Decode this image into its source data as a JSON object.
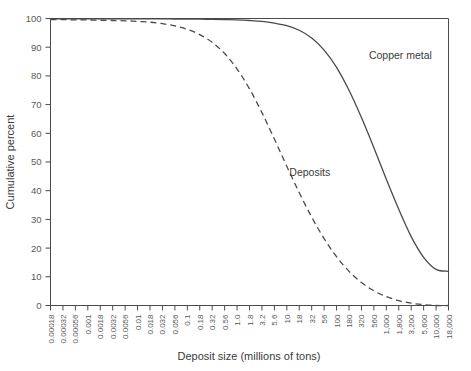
{
  "chart_data": {
    "type": "line",
    "title": "",
    "xlabel": "Deposit size (millions of tons)",
    "ylabel": "Cumulative percent",
    "ylim": [
      0,
      100
    ],
    "yticks": [
      0,
      10,
      20,
      30,
      40,
      50,
      60,
      70,
      80,
      90,
      100
    ],
    "grid": false,
    "legend_position": "inline-annotation",
    "xscale": "log",
    "categories": [
      "0.00018",
      "0.00032",
      "0.00056",
      "0.001",
      "0.0018",
      "0.0032",
      "0.0056",
      "0.01",
      "0.018",
      "0.032",
      "0.056",
      "0.1",
      "0.18",
      "0.32",
      "0.56",
      "1.0",
      "1.8",
      "3.2",
      "5.6",
      "10",
      "18",
      "32",
      "56",
      "100",
      "180",
      "320",
      "560",
      "1,000",
      "1,800",
      "3,200",
      "5,600",
      "10,000",
      "18,000"
    ],
    "series": [
      {
        "name": "Deposits",
        "style": "dashed",
        "label_x_index": 19.2,
        "label_y": 45,
        "values": [
          99.6,
          99.6,
          99.5,
          99.5,
          99.4,
          99.3,
          99.2,
          99.0,
          98.7,
          98.2,
          97.4,
          96.2,
          94.4,
          91.7,
          87.8,
          82.4,
          75.5,
          67.2,
          58.0,
          48.5,
          39.3,
          30.8,
          23.3,
          17.0,
          11.9,
          8.0,
          5.1,
          3.1,
          1.7,
          0.8,
          0.3,
          0.0,
          0.0
        ]
      },
      {
        "name": "Copper metal",
        "style": "solid",
        "label_x_index": 25.6,
        "label_y": 86,
        "values": [
          99.9,
          99.9,
          99.9,
          99.9,
          99.9,
          99.9,
          99.9,
          99.9,
          99.9,
          99.9,
          99.8,
          99.8,
          99.8,
          99.7,
          99.6,
          99.5,
          99.3,
          99.0,
          98.4,
          97.5,
          95.9,
          93.2,
          89.0,
          83.0,
          75.0,
          65.5,
          55.0,
          44.0,
          33.5,
          24.0,
          16.8,
          12.6,
          11.9
        ]
      }
    ]
  },
  "annotations": {
    "deposits_label": "Deposits",
    "copper_label": "Copper metal"
  }
}
